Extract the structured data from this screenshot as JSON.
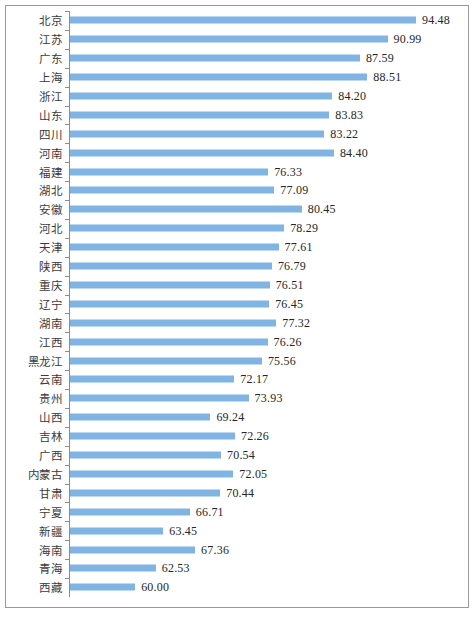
{
  "chart_data": {
    "type": "bar",
    "orientation": "horizontal",
    "title": "",
    "subtitle": "",
    "xlabel": "",
    "ylabel": "",
    "grid": false,
    "legend": null,
    "axis_baseline": 52.0,
    "xlim": [
      52.0,
      98.0
    ],
    "value_format": "two-decimal",
    "bar_color": "#7fb4e3",
    "categories": [
      "北京",
      "江苏",
      "广东",
      "上海",
      "浙江",
      "山东",
      "四川",
      "河南",
      "福建",
      "湖北",
      "安徽",
      "河北",
      "天津",
      "陕西",
      "重庆",
      "辽宁",
      "湖南",
      "江西",
      "黑龙江",
      "云南",
      "贵州",
      "山西",
      "吉林",
      "广西",
      "内蒙古",
      "甘肃",
      "宁夏",
      "新疆",
      "海南",
      "青海",
      "西藏"
    ],
    "values": [
      94.48,
      90.99,
      87.59,
      88.51,
      84.2,
      83.83,
      83.22,
      84.4,
      76.33,
      77.09,
      80.45,
      78.29,
      77.61,
      76.79,
      76.51,
      76.45,
      77.32,
      76.26,
      75.56,
      72.17,
      73.93,
      69.24,
      72.26,
      70.54,
      72.05,
      70.44,
      66.71,
      63.45,
      67.36,
      62.53,
      60.0
    ],
    "labels": [
      "94.48",
      "90.99",
      "87.59",
      "88.51",
      "84.20",
      "83.83",
      "83.22",
      "84.40",
      "76.33",
      "77.09",
      "80.45",
      "78.29",
      "77.61",
      "76.79",
      "76.51",
      "76.45",
      "77.32",
      "76.26",
      "75.56",
      "72.17",
      "73.93",
      "69.24",
      "72.26",
      "70.54",
      "72.05",
      "70.44",
      "66.71",
      "63.45",
      "67.36",
      "62.53",
      "60.00"
    ]
  }
}
